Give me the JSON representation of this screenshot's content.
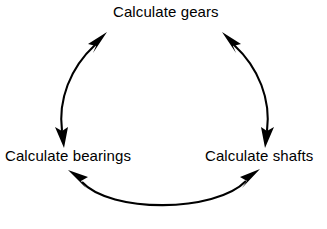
{
  "diagram": {
    "type": "cycle",
    "title": "",
    "background_color": "#ffffff",
    "stroke_color": "#000000",
    "nodes": [
      {
        "id": "gears",
        "label": "Calculate gears",
        "position": "top-center"
      },
      {
        "id": "bearings",
        "label": "Calculate bearings",
        "position": "bottom-left"
      },
      {
        "id": "shafts",
        "label": "Calculate shafts",
        "position": "bottom-right"
      }
    ],
    "edges": [
      {
        "id": "edge-gears-bearings",
        "from": "gears",
        "to": "bearings",
        "direction": "bidirectional",
        "shape": "arc-left"
      },
      {
        "id": "edge-bearings-shafts",
        "from": "bearings",
        "to": "shafts",
        "direction": "bidirectional",
        "shape": "arc-bottom"
      },
      {
        "id": "edge-shafts-gears",
        "from": "shafts",
        "to": "gears",
        "direction": "bidirectional",
        "shape": "arc-right"
      }
    ]
  }
}
